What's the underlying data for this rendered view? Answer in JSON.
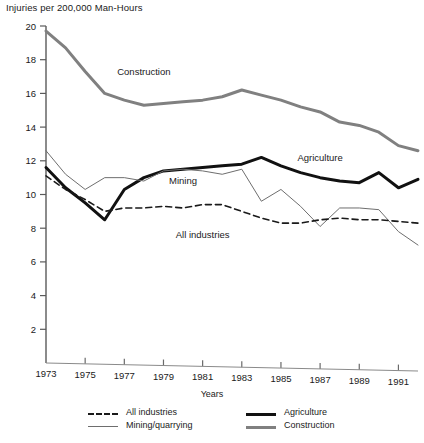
{
  "chart_data": {
    "type": "line",
    "title": "",
    "ylabel": "Injuries per 200,000 Man-Hours",
    "xlabel": "Years",
    "ylim": [
      0,
      20
    ],
    "xlim": [
      1973,
      1992
    ],
    "y_ticks": [
      2,
      4,
      6,
      8,
      10,
      12,
      14,
      16,
      18,
      20
    ],
    "x_ticks": [
      1973,
      1975,
      1977,
      1979,
      1981,
      1983,
      1985,
      1987,
      1989,
      1991
    ],
    "grid": false,
    "legend_position": "bottom",
    "x": [
      1973,
      1974,
      1975,
      1976,
      1977,
      1978,
      1979,
      1980,
      1981,
      1982,
      1983,
      1984,
      1985,
      1986,
      1987,
      1988,
      1989,
      1990,
      1991,
      1992
    ],
    "series": [
      {
        "name": "Construction",
        "style": "thick-gray",
        "color": "#808080",
        "values": [
          19.7,
          18.7,
          17.3,
          16.0,
          15.6,
          15.3,
          15.4,
          15.5,
          15.6,
          15.8,
          16.2,
          15.9,
          15.6,
          15.2,
          14.9,
          14.3,
          14.1,
          13.7,
          12.9,
          12.6
        ]
      },
      {
        "name": "Agriculture",
        "style": "thick-black",
        "color": "#111111",
        "values": [
          11.6,
          10.4,
          9.5,
          8.5,
          10.3,
          11.0,
          11.4,
          11.5,
          11.6,
          11.7,
          11.8,
          12.2,
          11.7,
          11.3,
          11.0,
          10.8,
          10.7,
          11.3,
          10.4,
          10.9
        ]
      },
      {
        "name": "Mining/quarrying",
        "style": "thin",
        "color": "#6e6e6e",
        "values": [
          12.6,
          11.2,
          10.3,
          11.0,
          11.0,
          10.8,
          11.4,
          11.5,
          11.4,
          11.2,
          11.5,
          9.6,
          10.3,
          9.3,
          8.1,
          9.2,
          9.2,
          9.1,
          7.8,
          7.0
        ]
      },
      {
        "name": "All industries",
        "style": "dashed",
        "color": "#1a1a1a",
        "values": [
          11.1,
          10.3,
          9.7,
          9.0,
          9.2,
          9.2,
          9.3,
          9.2,
          9.4,
          9.4,
          9.0,
          8.6,
          8.3,
          8.3,
          8.5,
          8.6,
          8.5,
          8.5,
          8.4,
          8.3
        ]
      }
    ],
    "annotations": [
      {
        "text": "Construction",
        "x": 1978,
        "y": 17.1
      },
      {
        "text": "Agriculture",
        "x": 1987,
        "y": 12.0
      },
      {
        "text": "Mining",
        "x": 1980,
        "y": 10.6
      },
      {
        "text": "All industries",
        "x": 1981,
        "y": 7.4
      }
    ]
  },
  "legend": {
    "items": [
      {
        "label": "All industries",
        "style": "dashed"
      },
      {
        "label": "Mining/quarrying",
        "style": "thin"
      },
      {
        "label": "Agriculture",
        "style": "thick-black"
      },
      {
        "label": "Construction",
        "style": "thick-gray"
      }
    ]
  },
  "axis": {
    "y_title": "Injuries per 200,000 Man-Hours",
    "x_title": "Years",
    "y_tick_labels": [
      "20",
      "18",
      "16",
      "14",
      "12",
      "10",
      "8",
      "6",
      "4",
      "2"
    ],
    "x_tick_labels": [
      "1973",
      "1975",
      "1977",
      "1979",
      "1981",
      "1983",
      "1985",
      "1987",
      "1989",
      "1991"
    ]
  }
}
